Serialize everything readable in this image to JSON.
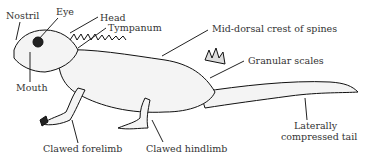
{
  "diagram": {
    "labels": {
      "nostril": "Nostril",
      "eye": "Eye",
      "head": "Head",
      "tympanum": "Tympanum",
      "mid_dorsal_crest": "Mid-dorsal crest of spines",
      "granular_scales": "Granular scales",
      "mouth": "Mouth",
      "clawed_forelimb": "Clawed forelimb",
      "clawed_hindlimb": "Clawed hindlimb",
      "tail_line1": "Laterally",
      "tail_line2": "compressed tail"
    }
  }
}
